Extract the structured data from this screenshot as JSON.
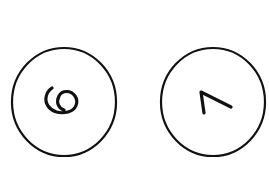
{
  "background_color": "#ffffff",
  "stroke_color": "#111111",
  "items": [
    {
      "digit": "6",
      "rotation": "rotated ~90deg clockwise"
    },
    {
      "digit": "7",
      "rotation": "rotated ~90deg clockwise"
    }
  ]
}
